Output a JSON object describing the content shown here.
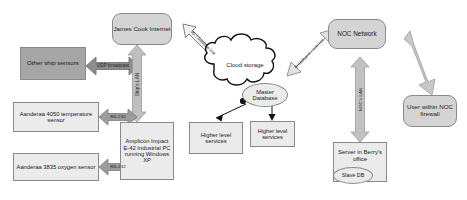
{
  "diagram": {
    "colors": {
      "arrow_fill": "#b3b3b3",
      "arrow_stroke": "#8f8f8f",
      "node_dark": "#a6a6a6",
      "node_mid": "#d4d4d4",
      "node_light": "#ebebeb",
      "cloud_fill": "#ffffff",
      "cloud_stroke": "#111111",
      "text": "#1a1a1a"
    },
    "nodes": [
      {
        "id": "other-ship-sensors",
        "label": "Other ship sensors",
        "shape": "rect",
        "fill": "dark"
      },
      {
        "id": "james-cook-internet",
        "label": "James Cook Internet",
        "shape": "rounded",
        "fill": "mid"
      },
      {
        "id": "aanderaa-4050",
        "label": "Aanderaa 4050 temperature sensor",
        "shape": "rect",
        "fill": "light"
      },
      {
        "id": "aanderaa-3835",
        "label": "Aanderaa 3835 oxygen sensor",
        "shape": "rect",
        "fill": "light"
      },
      {
        "id": "amplicon-pc",
        "label": "Amplicon Impact E-42 Industrial PC running Windows XP",
        "shape": "rect",
        "fill": "light"
      },
      {
        "id": "cloud-storage",
        "label": "Cloud storage",
        "shape": "cloud",
        "fill": "white"
      },
      {
        "id": "master-database",
        "label": "Master Database",
        "shape": "ellipse",
        "fill": "light"
      },
      {
        "id": "higher-level-services-1",
        "label": "Higher level services",
        "shape": "rect",
        "fill": "light"
      },
      {
        "id": "higher-level-services-2",
        "label": "Higher level services",
        "shape": "rect",
        "fill": "light"
      },
      {
        "id": "noc-network",
        "label": "NOC Network",
        "shape": "rounded",
        "fill": "mid"
      },
      {
        "id": "server-berrys-office",
        "label": "Server in Berry's office",
        "shape": "rect",
        "fill": "light"
      },
      {
        "id": "slave-db",
        "label": "Slave DB",
        "shape": "ellipse",
        "fill": "light"
      },
      {
        "id": "user-noc-firewall",
        "label": "User within NOC firewall",
        "shape": "rounded",
        "fill": "mid"
      }
    ],
    "edge_labels": {
      "udp_broadcast": "UDP broadcast",
      "ships_lan": "Ship's LAN",
      "rs232_temperature": "RS-232",
      "rs232_oxygen": "RS-232",
      "satellite_link": "3G / Satellite link",
      "broadband_internet": "Broadband / internet",
      "nocs_lan": "NOC's LAN"
    }
  }
}
